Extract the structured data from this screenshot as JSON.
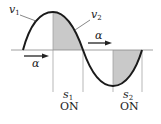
{
  "diagram": {
    "curve_labels": {
      "v1": {
        "base": "v",
        "sub": "1"
      },
      "v2": {
        "base": "v",
        "sub": "2"
      }
    },
    "alpha_arrows": [
      {
        "label": "α",
        "direction": "right"
      },
      {
        "label": "α",
        "direction": "right"
      }
    ],
    "switches": [
      {
        "name": {
          "base": "s",
          "sub": "1"
        },
        "state": "ON"
      },
      {
        "name": {
          "base": "s",
          "sub": "2"
        },
        "state": "ON"
      }
    ],
    "colors": {
      "curve": "#1a1a1a",
      "shade": "#c9c9c9",
      "axis": "#888888",
      "guides": "#9a9a9a"
    }
  }
}
